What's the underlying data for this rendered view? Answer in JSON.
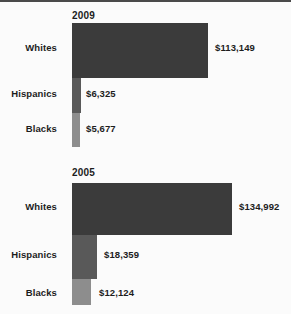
{
  "chart_data": {
    "type": "bar",
    "orientation": "horizontal",
    "title": "",
    "xlabel": "",
    "ylabel": "",
    "grid": false,
    "legend": false,
    "groups": [
      {
        "name": "2009",
        "categories": [
          "Whites",
          "Hispanics",
          "Blacks"
        ],
        "values": [
          113149,
          6325,
          5677
        ],
        "value_labels": [
          "$113,149",
          "$6,325",
          "$5,677"
        ]
      },
      {
        "name": "2005",
        "categories": [
          "Whites",
          "Hispanics",
          "Blacks"
        ],
        "values": [
          134992,
          18359,
          12124
        ],
        "value_labels": [
          "$134,992",
          "$18,359",
          "$12,124"
        ]
      }
    ],
    "colors": {
      "whites": "#3b3b3b",
      "hispanics": "#595959",
      "blacks": "#8d8d8d",
      "background": "#fbfbfb",
      "text": "#1d1d1d"
    }
  }
}
